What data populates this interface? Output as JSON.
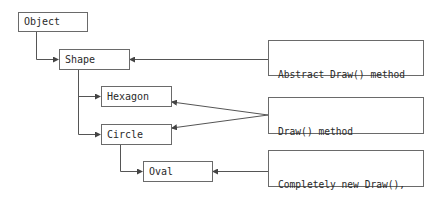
{
  "diagram": {
    "classes": [
      {
        "id": "object",
        "label": "Object"
      },
      {
        "id": "shape",
        "label": "Shape"
      },
      {
        "id": "hexagon",
        "label": "Hexagon"
      },
      {
        "id": "circle",
        "label": "Circle"
      },
      {
        "id": "oval",
        "label": "Oval"
      }
    ],
    "notes": [
      {
        "id": "note-abstract",
        "line1": "Abstract Draw() method",
        "line2": "defined here",
        "targets": [
          "shape"
        ]
      },
      {
        "id": "note-implemented",
        "line1": "Draw() method",
        "line2": "implemented here and here",
        "targets": [
          "hexagon",
          "circle"
        ]
      },
      {
        "id": "note-new",
        "line1": "Completely new Draw(),",
        "line2": "hiding Circle.Draw()",
        "targets": [
          "oval"
        ]
      }
    ],
    "inheritance": [
      {
        "from": "object",
        "to": "shape"
      },
      {
        "from": "shape",
        "to": "hexagon"
      },
      {
        "from": "shape",
        "to": "circle"
      },
      {
        "from": "circle",
        "to": "oval"
      }
    ],
    "colors": {
      "line": "#555555",
      "border": "#6a6a6a",
      "text": "#2a2a2a"
    }
  }
}
